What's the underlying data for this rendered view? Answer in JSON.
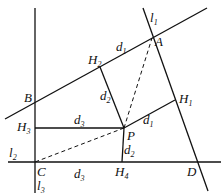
{
  "diagram": {
    "type": "geometry",
    "lines": [
      {
        "id": "AB",
        "name": "line-AB",
        "from": [
          5,
          119
        ],
        "to": [
          207,
          8
        ]
      },
      {
        "id": "l1",
        "name": "line-l1",
        "from": [
          143,
          8
        ],
        "to": [
          208,
          191
        ]
      },
      {
        "id": "l2",
        "name": "line-l2",
        "from": [
          8,
          162
        ],
        "to": [
          221,
          162
        ]
      },
      {
        "id": "l3",
        "name": "line-l3",
        "from": [
          35,
          8
        ],
        "to": [
          35,
          193
        ]
      }
    ],
    "segments": [
      {
        "name": "P-to-H2",
        "from": [
          124,
          128
        ],
        "to": [
          100,
          67
        ],
        "dashed": false
      },
      {
        "name": "P-to-H1",
        "from": [
          124,
          128
        ],
        "to": [
          175,
          100
        ],
        "dashed": false
      },
      {
        "name": "P-to-H3",
        "from": [
          124,
          128
        ],
        "to": [
          35,
          128
        ],
        "dashed": false
      },
      {
        "name": "P-to-H4",
        "from": [
          124,
          128
        ],
        "to": [
          122,
          162
        ],
        "dashed": false
      },
      {
        "name": "P-to-A",
        "from": [
          124,
          128
        ],
        "to": [
          152,
          38
        ],
        "dashed": true
      },
      {
        "name": "P-to-C",
        "from": [
          124,
          128
        ],
        "to": [
          35,
          162
        ],
        "dashed": true
      }
    ],
    "labels": {
      "l1": {
        "main": "l",
        "sub": "1"
      },
      "l2": {
        "main": "l",
        "sub": "2"
      },
      "l3": {
        "main": "l",
        "sub": "3"
      },
      "A": {
        "main": "A"
      },
      "B": {
        "main": "B"
      },
      "C": {
        "main": "C"
      },
      "D": {
        "main": "D"
      },
      "P": {
        "main": "P"
      },
      "H1": {
        "main": "H",
        "sub": "1"
      },
      "H2": {
        "main": "H",
        "sub": "2"
      },
      "H3": {
        "main": "H",
        "sub": "3"
      },
      "H4": {
        "main": "H",
        "sub": "4"
      },
      "d1_top": {
        "main": "d",
        "sub": "1"
      },
      "d1_right": {
        "main": "d",
        "sub": "1"
      },
      "d2_upper": {
        "main": "d",
        "sub": "2"
      },
      "d2_lower": {
        "main": "d",
        "sub": "2"
      },
      "d3_mid": {
        "main": "d",
        "sub": "3"
      },
      "d3_bottom": {
        "main": "d",
        "sub": "3"
      }
    },
    "stroke_color": "#111111"
  }
}
